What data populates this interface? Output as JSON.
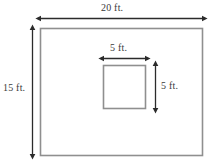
{
  "figure": {
    "type": "geometry-diagram",
    "colors": {
      "background": "#ffffff",
      "shape_outline": "#8a8a8a",
      "dimension_line": "#2b2b2b",
      "label_text": "#3a3a3a"
    },
    "outer_rectangle": {
      "name": "outer-rectangle",
      "width_label": "20 ft.",
      "height_label": "15 ft.",
      "width_value": 20,
      "height_value": 15,
      "unit": "ft."
    },
    "inner_square": {
      "name": "inner-square",
      "width_label": "5 ft.",
      "height_label": "5 ft.",
      "width_value": 5,
      "height_value": 5,
      "unit": "ft."
    },
    "dimension_lines": [
      {
        "name": "outer-width-dimension",
        "orientation": "horizontal",
        "label": "20 ft."
      },
      {
        "name": "outer-height-dimension",
        "orientation": "vertical",
        "label": "15 ft."
      },
      {
        "name": "inner-width-dimension",
        "orientation": "horizontal",
        "label": "5 ft."
      },
      {
        "name": "inner-height-dimension",
        "orientation": "vertical",
        "label": "5 ft."
      }
    ]
  }
}
